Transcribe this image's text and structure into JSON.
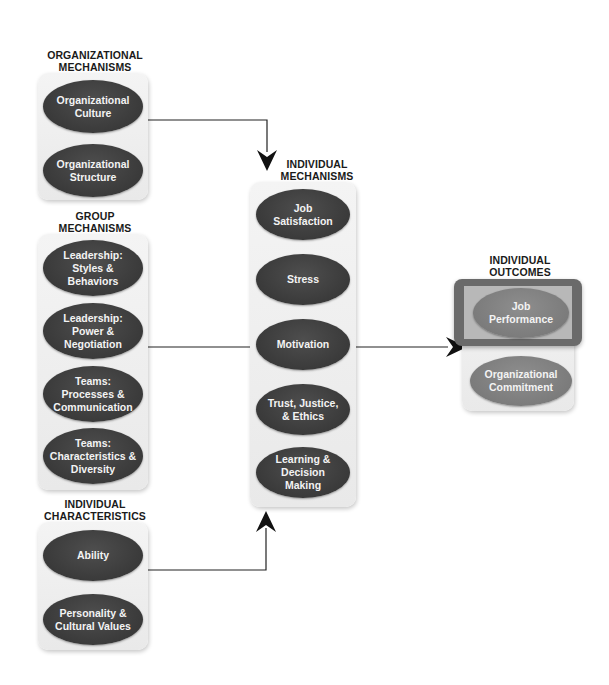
{
  "diagram": {
    "type": "flow-diagram",
    "colors": {
      "oval_dark": "#3c3c3c",
      "oval_highlight": "#7a7a7a",
      "panel_bg": "#eeeeee",
      "highlight_frame": "#6a6a6a",
      "text_dark": "#1a1a1a",
      "text_light": "#f3f3f3",
      "arrow": "#111111"
    },
    "groups": {
      "organizational": {
        "title": "ORGANIZATIONAL\nMECHANISMS",
        "title_line1": "ORGANIZATIONAL",
        "title_line2": "MECHANISMS",
        "items": [
          {
            "label": "Organizational\nCulture"
          },
          {
            "label": "Organizational\nStructure"
          }
        ]
      },
      "group": {
        "title_line1": "GROUP",
        "title_line2": "MECHANISMS",
        "items": [
          {
            "label": "Leadership:\nStyles &\nBehaviors"
          },
          {
            "label": "Leadership:\nPower &\nNegotiation"
          },
          {
            "label": "Teams:\nProcesses &\nCommunication"
          },
          {
            "label": "Teams:\nCharacteristics &\nDiversity"
          }
        ]
      },
      "characteristics": {
        "title_line1": "INDIVIDUAL",
        "title_line2": "CHARACTERISTICS",
        "items": [
          {
            "label": "Ability"
          },
          {
            "label": "Personality &\nCultural Values"
          }
        ]
      },
      "individual_mechanisms": {
        "title_line1": "INDIVIDUAL",
        "title_line2": "MECHANISMS",
        "items": [
          {
            "label": "Job\nSatisfaction"
          },
          {
            "label": "Stress"
          },
          {
            "label": "Motivation"
          },
          {
            "label": "Trust, Justice,\n& Ethics"
          },
          {
            "label": "Learning &\nDecision Making"
          }
        ]
      },
      "outcomes": {
        "title_line1": "INDIVIDUAL",
        "title_line2": "OUTCOMES",
        "items": [
          {
            "label": "Job\nPerformance",
            "highlighted": true
          },
          {
            "label": "Organizational\nCommitment",
            "highlighted": false
          }
        ]
      }
    },
    "connections": [
      {
        "from": "Organizational Mechanisms",
        "to": "Individual Mechanisms"
      },
      {
        "from": "Group Mechanisms",
        "to": "Individual Mechanisms"
      },
      {
        "from": "Individual Characteristics",
        "to": "Individual Mechanisms"
      },
      {
        "from": "Individual Mechanisms",
        "to": "Individual Outcomes"
      }
    ]
  }
}
